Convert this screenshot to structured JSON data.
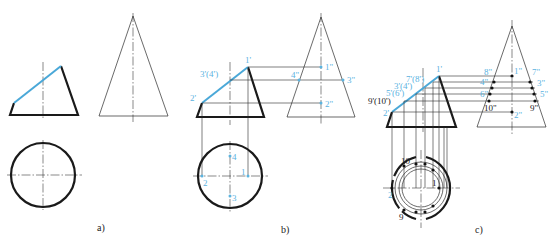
{
  "figure": {
    "colors": {
      "outline": "#1a1a1a",
      "cut_line": "#4aa8d8",
      "label_blue": "#5bb3df"
    }
  },
  "panels": [
    {
      "id": "a",
      "caption": "a)"
    },
    {
      "id": "b",
      "caption": "b)",
      "front_labels": {
        "p1": "1'",
        "p34": "3'(4')",
        "p2": "2'"
      },
      "side_labels": {
        "p1": "1\"",
        "p4": "4\"",
        "p3": "3\"",
        "p2": "2\""
      },
      "top_labels": {
        "p4": "4",
        "p1": "1",
        "p2": "2",
        "p3": "3"
      }
    },
    {
      "id": "c",
      "caption": "c)",
      "front_labels": {
        "p1": "1'",
        "p78": "7'(8')",
        "p34": "3'(4')",
        "p56": "5'(6')",
        "p910": "9'(10')",
        "p2": "2'"
      },
      "side_labels": {
        "p8": "8\"",
        "p1": "1\"",
        "p7": "7\"",
        "p4": "4\"",
        "p3": "3\"",
        "p6": "6\"",
        "p5": "5\"",
        "p10": "10\"",
        "p9": "9\"",
        "p2": "2\""
      },
      "top_labels": {
        "p10": "10",
        "p1": "1",
        "p2": "2",
        "p9": "9"
      }
    }
  ]
}
